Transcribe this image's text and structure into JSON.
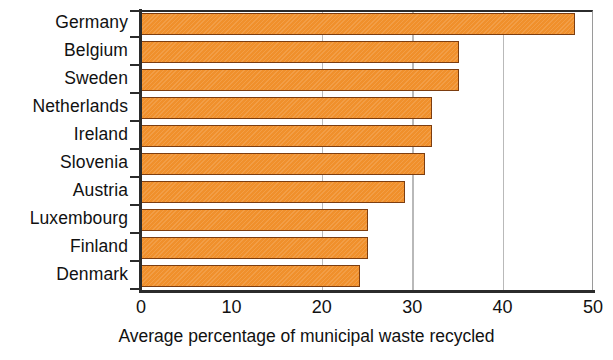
{
  "chart_data": {
    "type": "bar",
    "orientation": "horizontal",
    "title": "",
    "xlabel": "Average percentage of municipal waste recycled",
    "ylabel": "",
    "categories": [
      "Germany",
      "Belgium",
      "Sweden",
      "Netherlands",
      "Ireland",
      "Slovenia",
      "Austria",
      "Luxembourg",
      "Finland",
      "Denmark"
    ],
    "values": [
      48.0,
      35.2,
      35.2,
      32.2,
      32.2,
      31.4,
      29.2,
      25.1,
      25.1,
      24.2
    ],
    "xlim": [
      0,
      50
    ],
    "xticks": [
      0,
      10,
      20,
      30,
      40,
      50
    ],
    "xtick_labels": [
      "0",
      "10",
      "20",
      "30",
      "40",
      "50"
    ],
    "gridlines_at": [
      20,
      30,
      40
    ],
    "grid": true,
    "legend": null,
    "bar_color": "#F0902C",
    "bar_edge_color": "#7C3D10",
    "grid_color": "#B9B9B9",
    "axis_color": "#2B2B2B",
    "background_color": "#FFFFFF"
  }
}
